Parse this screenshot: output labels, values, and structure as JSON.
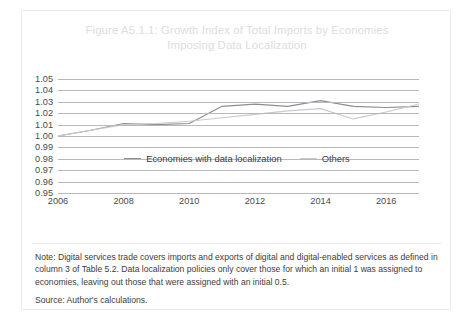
{
  "figure": {
    "title_line1": "Figure A5.1.1: Growth Index of Total Imports by Economies",
    "title_line2": "Imposing Data Localization",
    "note": "Note: Digital services trade covers imports and exports of digital and digital-enabled services as defined in column 3 of Table 5.2. Data localization policies only cover those for which an initial 1 was assigned to economies, leaving out those that were assigned with an initial 0.5.",
    "source": "Source: Author's calculations."
  },
  "colors": {
    "title": "#dcdce2",
    "gridline": "#b9b9bd",
    "series_localization": "#8d8d93",
    "series_others": "#c9c9cf",
    "text": "#3d3d3d",
    "border": "#e9e9ee"
  },
  "chart_data": {
    "type": "line",
    "title": "Figure A5.1.1: Growth Index of Total Imports by Economies Imposing Data Localization",
    "xlabel": "",
    "ylabel": "",
    "x": [
      2006,
      2007,
      2008,
      2009,
      2010,
      2011,
      2012,
      2013,
      2014,
      2015,
      2016,
      2017
    ],
    "xticks": [
      "2006",
      "2008",
      "2010",
      "2012",
      "2014",
      "2016"
    ],
    "xtick_values": [
      2006,
      2008,
      2010,
      2012,
      2014,
      2016
    ],
    "yticks": [
      "1.05",
      "1.04",
      "1.03",
      "1.02",
      "1.01",
      "1.00",
      "0.99",
      "0.98",
      "0.97",
      "0.96",
      "0.95"
    ],
    "ytick_values": [
      1.05,
      1.04,
      1.03,
      1.02,
      1.01,
      1.0,
      0.99,
      0.98,
      0.97,
      0.96,
      0.95
    ],
    "ylim": [
      0.95,
      1.05
    ],
    "xlim": [
      2006,
      2017
    ],
    "grid": true,
    "legend_position": "bottom",
    "series": [
      {
        "name": "Economies with data localization",
        "color": "#8d8d93",
        "values": [
          1.0,
          1.005,
          1.011,
          1.01,
          1.011,
          1.026,
          1.028,
          1.026,
          1.031,
          1.026,
          1.025,
          1.026
        ]
      },
      {
        "name": "Others",
        "color": "#c9c9cf",
        "values": [
          1.0,
          1.005,
          1.01,
          1.011,
          1.013,
          1.016,
          1.019,
          1.022,
          1.024,
          1.015,
          1.021,
          1.028
        ]
      }
    ]
  },
  "legend": {
    "items": [
      {
        "label": "Economies with data localization",
        "color": "#8d8d93"
      },
      {
        "label": "Others",
        "color": "#c9c9cf"
      }
    ]
  }
}
